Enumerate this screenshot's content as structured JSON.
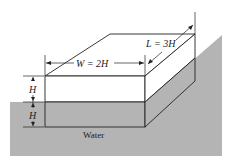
{
  "diagram": {
    "type": "floating-block-in-water",
    "labels": {
      "width": "W = 2H",
      "length": "L = 3H",
      "height_above": "H",
      "height_below": "H",
      "water": "Water"
    },
    "colors": {
      "water": "#b4b4b4",
      "block_face": "#ffffff",
      "lines": "#222222"
    }
  }
}
